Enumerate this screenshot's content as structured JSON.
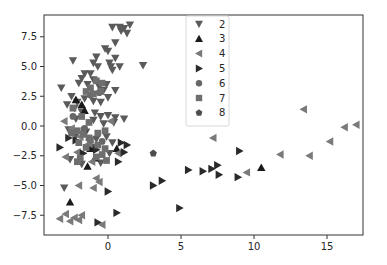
{
  "chart_data": {
    "type": "scatter",
    "title": "",
    "xlabel": "",
    "ylabel": "",
    "xlim": [
      -4.4,
      17.4
    ],
    "ylim": [
      -9.2,
      9.3
    ],
    "xticks": [
      0,
      5,
      10,
      15
    ],
    "xtick_labels": [
      "0",
      "5",
      "10",
      "15"
    ],
    "yticks": [
      7.5,
      5.0,
      2.5,
      0.0,
      -2.5,
      -5.0,
      -7.5
    ],
    "ytick_labels": [
      "7.5",
      "5.0",
      "2.5",
      "0.0",
      "−2.5",
      "−5.0",
      "−7.5"
    ],
    "grid": false,
    "legend_position": "upper center",
    "series": [
      {
        "name": "2",
        "marker": "triangle_down",
        "color": "#5a5a5a",
        "points": [
          [
            0.3,
            8.3
          ],
          [
            0.8,
            8.3
          ],
          [
            1.1,
            8.2
          ],
          [
            1.5,
            8.5
          ],
          [
            0.9,
            8.0
          ],
          [
            1.3,
            7.8
          ],
          [
            0.5,
            7.0
          ],
          [
            0.0,
            6.3
          ],
          [
            -0.2,
            6.5
          ],
          [
            -2.4,
            5.5
          ],
          [
            -0.8,
            5.8
          ],
          [
            -1.0,
            5.3
          ],
          [
            -0.7,
            5.0
          ],
          [
            0.1,
            5.3
          ],
          [
            0.5,
            5.7
          ],
          [
            0.2,
            5.0
          ],
          [
            0.3,
            4.7
          ],
          [
            0.8,
            5.0
          ],
          [
            2.4,
            5.1
          ],
          [
            -1.6,
            4.4
          ],
          [
            -1.2,
            4.4
          ],
          [
            -1.8,
            4.0
          ],
          [
            -1.0,
            3.9
          ],
          [
            -2.0,
            3.6
          ],
          [
            -1.4,
            3.5
          ],
          [
            -0.6,
            3.3
          ],
          [
            -0.1,
            3.5
          ],
          [
            0.5,
            3.0
          ],
          [
            -0.3,
            3.0
          ],
          [
            -3.2,
            3.2
          ],
          [
            -2.5,
            2.5
          ],
          [
            -2.1,
            2.0
          ],
          [
            -1.6,
            2.3
          ],
          [
            -1.0,
            2.1
          ],
          [
            -0.5,
            2.0
          ],
          [
            0.0,
            2.4
          ],
          [
            -2.8,
            1.8
          ],
          [
            -2.3,
            1.5
          ],
          [
            -1.8,
            1.2
          ],
          [
            -0.9,
            1.1
          ],
          [
            -0.5,
            0.8
          ],
          [
            0.0,
            0.9
          ],
          [
            0.5,
            0.7
          ],
          [
            1.1,
            0.6
          ],
          [
            -2.2,
            0.6
          ],
          [
            -1.0,
            0.5
          ],
          [
            -0.3,
            0.2
          ],
          [
            0.4,
            0.3
          ],
          [
            -2.7,
            -0.3
          ],
          [
            -2.2,
            -0.8
          ],
          [
            -1.5,
            -0.5
          ],
          [
            -0.8,
            -1.1
          ],
          [
            -0.1,
            -0.9
          ],
          [
            0.3,
            -1.4
          ],
          [
            -2.6,
            -2.8
          ],
          [
            -1.8,
            -3.2
          ],
          [
            -0.5,
            -3.1
          ],
          [
            -3.0,
            -5.2
          ],
          [
            0.1,
            -2.3
          ],
          [
            -1.1,
            -1.8
          ]
        ]
      },
      {
        "name": "3",
        "marker": "triangle_up",
        "color": "#1a1a1a",
        "points": [
          [
            -2.2,
            2.2
          ],
          [
            -1.8,
            1.8
          ],
          [
            -1.6,
            1.3
          ],
          [
            -1.2,
            -1.9
          ],
          [
            -0.9,
            -2.7
          ],
          [
            -1.4,
            -3.4
          ],
          [
            -2.6,
            -6.4
          ],
          [
            10.5,
            -3.5
          ],
          [
            0.6,
            -1.9
          ]
        ]
      },
      {
        "name": "4",
        "marker": "triangle_left",
        "color": "#7a7a7a",
        "points": [
          [
            -3.0,
            0.4
          ],
          [
            -2.5,
            -0.2
          ],
          [
            -1.9,
            -0.9
          ],
          [
            -1.3,
            -1.5
          ],
          [
            0.7,
            -2.3
          ],
          [
            -2.9,
            -2.6
          ],
          [
            -2.1,
            -2.2
          ],
          [
            -1.1,
            -3.0
          ],
          [
            -0.8,
            -4.4
          ],
          [
            -0.6,
            -4.7
          ],
          [
            -2.0,
            -5.0
          ],
          [
            -1.0,
            -5.2
          ],
          [
            -3.3,
            -7.8
          ],
          [
            -2.9,
            -7.4
          ],
          [
            -2.3,
            -7.7
          ],
          [
            -1.8,
            -7.5
          ],
          [
            -2.6,
            -8.0
          ],
          [
            -2.0,
            -7.9
          ],
          [
            -0.4,
            -8.3
          ],
          [
            7.2,
            -1.0
          ],
          [
            9.5,
            -3.9
          ],
          [
            11.8,
            -2.4
          ],
          [
            13.8,
            -2.5
          ],
          [
            15.2,
            -1.3
          ],
          [
            16.2,
            -0.1
          ],
          [
            17.0,
            0.1
          ],
          [
            13.4,
            1.4
          ],
          [
            0.2,
            0.4
          ]
        ]
      },
      {
        "name": "5",
        "marker": "triangle_right",
        "color": "#2a2a2a",
        "points": [
          [
            -3.3,
            -1.8
          ],
          [
            -2.2,
            -1.2
          ],
          [
            -1.7,
            -2.3
          ],
          [
            -0.8,
            -2.0
          ],
          [
            0.9,
            -1.4
          ],
          [
            1.1,
            -2.2
          ],
          [
            1.3,
            -1.6
          ],
          [
            0.7,
            -3.0
          ],
          [
            -2.7,
            -1.0
          ],
          [
            0.0,
            -5.5
          ],
          [
            0.6,
            -7.3
          ],
          [
            -0.7,
            -8.1
          ],
          [
            4.9,
            -6.9
          ],
          [
            3.1,
            -5.0
          ],
          [
            3.7,
            -4.6
          ],
          [
            5.5,
            -3.7
          ],
          [
            7.1,
            -3.6
          ],
          [
            6.5,
            -3.8
          ],
          [
            7.5,
            -3.3
          ],
          [
            7.6,
            -4.1
          ],
          [
            8.9,
            -4.3
          ],
          [
            9.0,
            -2.1
          ],
          [
            -1.6,
            -0.4
          ]
        ]
      },
      {
        "name": "6",
        "marker": "circle",
        "color": "#666666",
        "points": [
          [
            -1.2,
            2.6
          ],
          [
            -0.6,
            2.8
          ],
          [
            -2.4,
            0.8
          ],
          [
            -1.6,
            -0.2
          ],
          [
            -0.4,
            -1.3
          ]
        ]
      },
      {
        "name": "7",
        "marker": "square",
        "color": "#6e6e6e",
        "points": [
          [
            -0.8,
            3.8
          ],
          [
            -0.4,
            3.6
          ],
          [
            -1.2,
            3.2
          ],
          [
            -0.5,
            2.9
          ],
          [
            -1.0,
            2.7
          ],
          [
            -1.5,
            2.9
          ],
          [
            -2.4,
            1.5
          ],
          [
            -1.8,
            0.8
          ],
          [
            -1.3,
            0.3
          ],
          [
            -0.2,
            -0.4
          ],
          [
            -2.5,
            -0.6
          ],
          [
            -2.1,
            -0.4
          ],
          [
            -1.7,
            -0.7
          ],
          [
            -1.3,
            -1.0
          ],
          [
            -0.7,
            -0.6
          ],
          [
            -0.2,
            -1.9
          ],
          [
            -0.7,
            -1.6
          ],
          [
            -1.2,
            -1.2
          ],
          [
            -2.0,
            -1.4
          ],
          [
            -1.5,
            -1.8
          ],
          [
            -0.8,
            -2.6
          ],
          [
            -0.4,
            -2.4
          ],
          [
            -0.1,
            -2.9
          ],
          [
            -2.1,
            -3.0
          ],
          [
            -1.9,
            -2.7
          ]
        ]
      },
      {
        "name": "8",
        "marker": "pentagon",
        "color": "#4d4d4d",
        "points": [
          [
            3.1,
            -2.3
          ]
        ]
      }
    ]
  }
}
